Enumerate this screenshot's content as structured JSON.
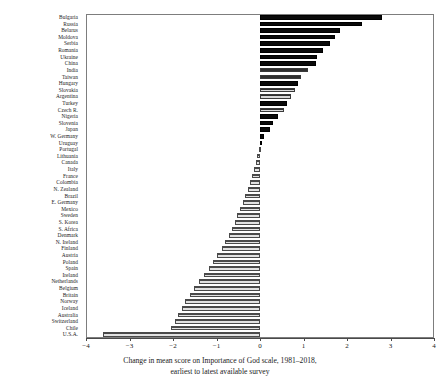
{
  "chart_data": {
    "type": "bar",
    "orientation": "horizontal",
    "title": "",
    "caption_line1": "Change in mean score on Importance of God scale, 1981–2018,",
    "caption_line2": "earliest to latest available survey",
    "xlabel": "",
    "ylabel": "",
    "xlim": [
      -4,
      4
    ],
    "xticks": [
      -4,
      -3,
      -2,
      -1,
      0,
      1,
      2,
      3,
      4
    ],
    "xtick_labels": [
      "−4",
      "−3",
      "−2",
      "−1",
      "0",
      "1",
      "2",
      "3",
      "4"
    ],
    "grid": false,
    "legend": "none",
    "zero_line": 0,
    "categories": [
      "Bulgaria",
      "Russia",
      "Belarus",
      "Moldova",
      "Serbia",
      "Romania",
      "Ukraine",
      "China",
      "India",
      "Taiwan",
      "Hungary",
      "Slovakia",
      "Argentina",
      "Turkey",
      "Czech R.",
      "Nigeria",
      "Slovenia",
      "Japan",
      "W. Germany",
      "Uruguay",
      "Portugal",
      "Lithuania",
      "Canada",
      "Italy",
      "France",
      "Colombia",
      "N. Zealand",
      "Brazil",
      "E. Germany",
      "Mexico",
      "Sweden",
      "S. Korea",
      "S. Africa",
      "Denmark",
      "N. Ireland",
      "Finland",
      "Austria",
      "Poland",
      "Spain",
      "Ireland",
      "Netherlands",
      "Belgium",
      "Britain",
      "Norway",
      "Iceland",
      "Australia",
      "Switzerland",
      "Chile",
      "U.S.A."
    ],
    "values": [
      2.8,
      2.35,
      1.85,
      1.72,
      1.62,
      1.45,
      1.3,
      1.28,
      1.1,
      0.95,
      0.88,
      0.8,
      0.72,
      0.62,
      0.55,
      0.42,
      0.3,
      0.22,
      0.1,
      0.04,
      -0.02,
      -0.06,
      -0.1,
      -0.14,
      -0.18,
      -0.22,
      -0.28,
      -0.34,
      -0.4,
      -0.46,
      -0.52,
      -0.58,
      -0.64,
      -0.72,
      -0.8,
      -0.88,
      -0.98,
      -1.08,
      -1.18,
      -1.28,
      -1.4,
      -1.52,
      -1.62,
      -1.72,
      -1.8,
      -1.88,
      -1.95,
      -2.05,
      -3.62
    ],
    "bar_styles": [
      "pos-dark",
      "pos-dark",
      "pos-dark",
      "pos-dark",
      "pos-dark",
      "pos-dark",
      "pos-dark",
      "pos-dark",
      "pos-gray",
      "pos-gray",
      "pos-dark",
      "pos-gray",
      "pos-gray",
      "pos-dark",
      "pos-gray",
      "pos-dark",
      "pos-dark",
      "pos-dark",
      "pos-dark",
      "pos-dark",
      "neg",
      "neg",
      "neg",
      "neg",
      "neg",
      "neg",
      "neg",
      "neg",
      "neg",
      "neg",
      "neg",
      "neg",
      "neg",
      "neg",
      "neg",
      "neg",
      "neg",
      "neg",
      "neg",
      "neg",
      "neg",
      "neg",
      "neg",
      "neg",
      "neg",
      "neg",
      "neg",
      "neg",
      "neg"
    ]
  }
}
